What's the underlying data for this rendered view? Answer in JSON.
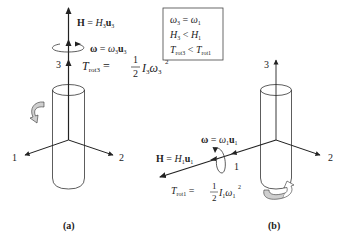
{
  "panels": [
    {
      "id": "a",
      "label": "(a)",
      "axes": {
        "axis1": "1",
        "axis2": "2",
        "axis3": "3"
      },
      "vectors": {
        "H": {
          "lhs": "H",
          "eq": " = ",
          "rhs_sym": "H",
          "rhs_sub": "3",
          "rhs_vec": "u",
          "rhs_vec_sub": "3"
        },
        "omega": {
          "lhs": "ω",
          "eq": " = ",
          "rhs_sym": "ω",
          "rhs_sub": "3",
          "rhs_vec": "u",
          "rhs_vec_sub": "3"
        }
      },
      "energy": {
        "T": "T",
        "T_sub": "rot3",
        "eq": " = ",
        "num": "1",
        "den": "2",
        "I": "I",
        "I_sub": "3",
        "w": "ω",
        "w_sub": "3",
        "w_sup": "2"
      }
    },
    {
      "id": "b",
      "label": "(b)",
      "axes": {
        "axis1": "1",
        "axis2": "2",
        "axis3": "3"
      },
      "vectors": {
        "H": {
          "lhs": "H",
          "eq": " = ",
          "rhs_sym": "H",
          "rhs_sub": "1",
          "rhs_vec": "u",
          "rhs_vec_sub": "1"
        },
        "omega": {
          "lhs": "ω",
          "eq": " = ",
          "rhs_sym": "ω",
          "rhs_sub": "1",
          "rhs_vec": "u",
          "rhs_vec_sub": "1"
        }
      },
      "energy": {
        "T": "T",
        "T_sub": "rot1",
        "eq": " = ",
        "num": "1",
        "den": "2",
        "I": "I",
        "I_sub": "1",
        "w": "ω",
        "w_sub": "1",
        "w_sup": "2"
      }
    }
  ],
  "comparison_box": {
    "line1": {
      "a": "ω",
      "a_sub": "3",
      "op": " = ",
      "b": "ω",
      "b_sub": "1"
    },
    "line2": {
      "a": "H",
      "a_sub": "3",
      "op": " < ",
      "b": "H",
      "b_sub": "1"
    },
    "line3": {
      "a": "T",
      "a_sub": "rot3",
      "op": " < ",
      "b": "T",
      "b_sub": "rot1"
    }
  },
  "colors": {
    "line": "#222222",
    "arrow_fill": "#cccccc"
  }
}
